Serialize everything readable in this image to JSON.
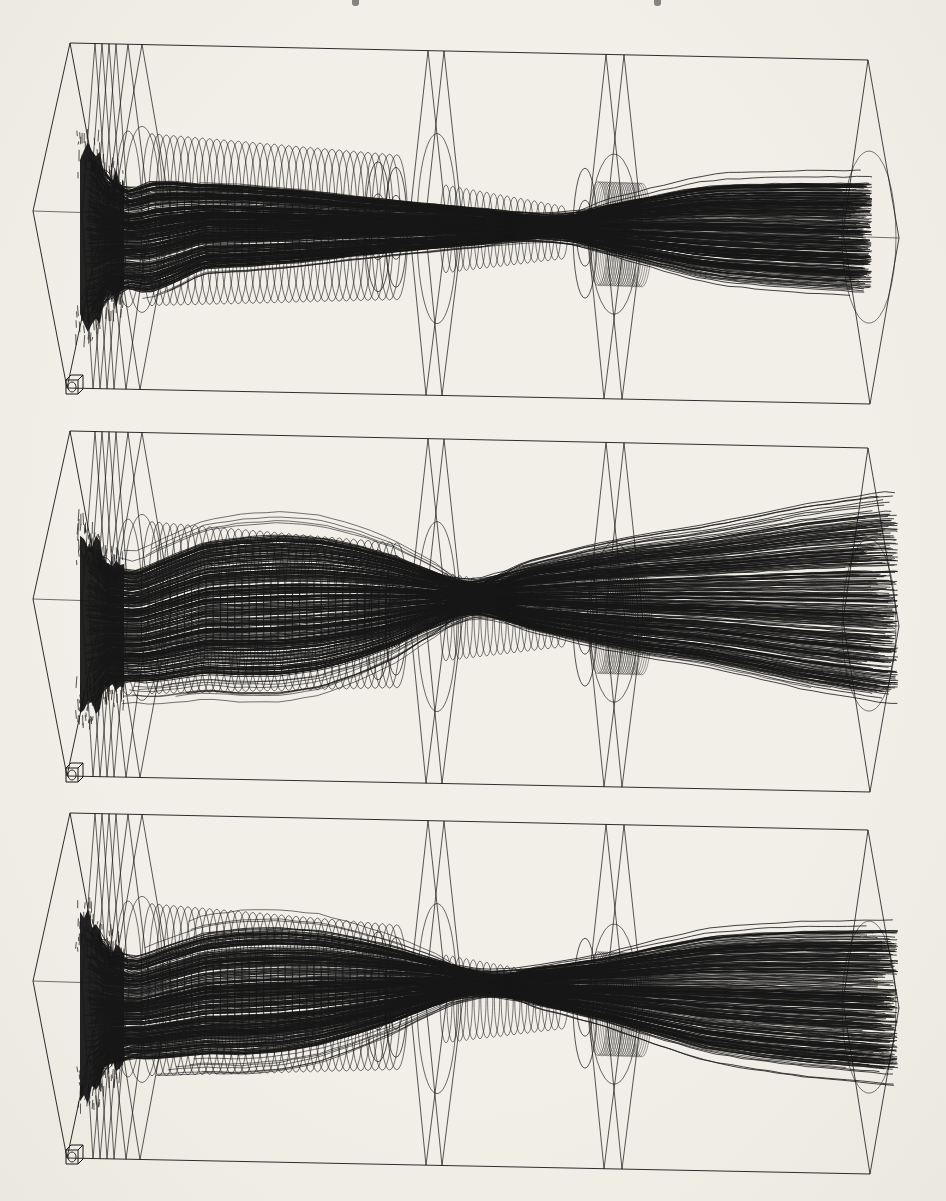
{
  "page": {
    "background_color": "#f0ede6",
    "ink_color": "#161616",
    "top_edge_cropped_text_marks": [
      352,
      654
    ]
  },
  "beamline": {
    "box": {
      "top_left": [
        70,
        7
      ],
      "top_right": [
        868,
        24
      ],
      "bottom_left": [
        67,
        352
      ],
      "bottom_right": [
        870,
        368
      ],
      "left_vertex": [
        33,
        175
      ],
      "right_vertex": [
        899,
        202
      ],
      "right_face_left_vertex": [
        843,
        196
      ]
    },
    "left_face_right_vertex": [
      103,
      183
    ],
    "left_planes_x": [
      95,
      102,
      109,
      116
    ],
    "left_plane_halfwidth": 13,
    "wide_planes": [
      {
        "x": 128,
        "halfwidth": 22,
        "circle_rx": 14,
        "circle_ry": 88
      },
      {
        "x": 142,
        "halfwidth": 30,
        "circle_rx": 19,
        "circle_ry": 93
      }
    ],
    "source_circles": [
      {
        "x": 104,
        "dy": -55,
        "rx": 8,
        "ry": 13
      },
      {
        "x": 106,
        "dy": 48,
        "rx": 8,
        "ry": 14
      }
    ],
    "rings_drift1": {
      "x_start": 152,
      "x_end": 398,
      "step": 7.2,
      "rx": 11,
      "ry_start": 86,
      "ry_slope": 0.055
    },
    "lens2": {
      "ellipse_pairs": [
        {
          "x": 378,
          "rx": 13,
          "ry_outer": 65,
          "ry_inner": 33
        },
        {
          "x": 396,
          "rx": 11,
          "ry_outer": 60,
          "ry_inner": 32
        }
      ],
      "plane_x": [
        428,
        444
      ],
      "plane_halfwidth": 19,
      "circle": {
        "x": 437,
        "rx": 20,
        "ry": 95
      }
    },
    "rings_drift2": {
      "x_start": 446,
      "x_end": 562,
      "step": 6.8,
      "rx": 6,
      "ry_start": 44,
      "ry_slope": 0.15
    },
    "lens3": {
      "ellipse_pairs": [
        {
          "x": 585,
          "rx": 12,
          "ry_outer": 65,
          "ry_inner": 33
        }
      ],
      "hatch": {
        "x_start": 598,
        "x_end": 642,
        "step": 2.3,
        "rx": 10,
        "ry": 52
      },
      "plane_x": [
        606,
        624
      ],
      "plane_halfwidth": 19,
      "circle": {
        "x": 614,
        "rx": 24,
        "ry": 80
      }
    },
    "right_face_circle": {
      "cx": 869,
      "rx": 27,
      "ry": 86
    },
    "origin_cube": {
      "x": 66,
      "y": 339
    },
    "ring_center_drop": 5
  },
  "panels": [
    {
      "name": "top",
      "seed": 11,
      "n_rays": 310,
      "envelope": [
        [
          86,
          84
        ],
        [
          98,
          82
        ],
        [
          106,
          56
        ],
        [
          116,
          60
        ],
        [
          126,
          50
        ],
        [
          150,
          57
        ],
        [
          175,
          52
        ],
        [
          200,
          44
        ],
        [
          250,
          41
        ],
        [
          300,
          37
        ],
        [
          350,
          31
        ],
        [
          400,
          26
        ],
        [
          450,
          21
        ],
        [
          500,
          17
        ],
        [
          545,
          15
        ],
        [
          575,
          17
        ],
        [
          605,
          23
        ],
        [
          635,
          30
        ],
        [
          665,
          37
        ],
        [
          695,
          44
        ],
        [
          725,
          48
        ],
        [
          760,
          50
        ],
        [
          800,
          52
        ],
        [
          840,
          53
        ],
        [
          862,
          54
        ]
      ],
      "center_offset": [
        [
          33,
          24
        ],
        [
          140,
          25
        ],
        [
          205,
          10
        ],
        [
          540,
          0
        ],
        [
          899,
          0
        ]
      ],
      "waist_x": 545,
      "blend": 70,
      "a_levels": 0,
      "b_levels": 0,
      "end_x": 872,
      "ragged": 40,
      "stray_rays": 5,
      "stray_amp": 0.09,
      "outlier_frac": 0.05
    },
    {
      "name": "middle",
      "seed": 22,
      "n_rays": 310,
      "envelope": [
        [
          86,
          84
        ],
        [
          98,
          80
        ],
        [
          106,
          56
        ],
        [
          116,
          60
        ],
        [
          130,
          56
        ],
        [
          160,
          62
        ],
        [
          200,
          67
        ],
        [
          240,
          71
        ],
        [
          280,
          72
        ],
        [
          320,
          68
        ],
        [
          360,
          58
        ],
        [
          395,
          46
        ],
        [
          425,
          32
        ],
        [
          450,
          24
        ],
        [
          475,
          19
        ],
        [
          500,
          24
        ],
        [
          540,
          33
        ],
        [
          590,
          44
        ],
        [
          640,
          53
        ],
        [
          700,
          61
        ],
        [
          750,
          70
        ],
        [
          800,
          80
        ],
        [
          847,
          87
        ],
        [
          884,
          92
        ]
      ],
      "center_offset": [
        [
          33,
          24
        ],
        [
          140,
          24
        ],
        [
          205,
          4
        ],
        [
          380,
          -8
        ],
        [
          480,
          -16
        ],
        [
          700,
          -21
        ],
        [
          899,
          -23
        ]
      ],
      "waist_x": 478,
      "blend": 55,
      "a_levels": 64,
      "b_levels": 34,
      "end_x": 898,
      "ragged": 55,
      "stray_rays": 14,
      "stray_amp": 0.32,
      "outlier_frac": 0.14
    },
    {
      "name": "bottom",
      "seed": 33,
      "n_rays": 310,
      "envelope": [
        [
          86,
          84
        ],
        [
          98,
          80
        ],
        [
          106,
          55
        ],
        [
          116,
          58
        ],
        [
          130,
          51
        ],
        [
          160,
          56
        ],
        [
          200,
          61
        ],
        [
          240,
          64
        ],
        [
          280,
          63
        ],
        [
          320,
          58
        ],
        [
          360,
          48
        ],
        [
          395,
          38
        ],
        [
          425,
          27
        ],
        [
          455,
          18
        ],
        [
          485,
          13
        ],
        [
          515,
          15
        ],
        [
          555,
          21
        ],
        [
          605,
          31
        ],
        [
          655,
          44
        ],
        [
          705,
          56
        ],
        [
          755,
          62
        ],
        [
          805,
          66
        ],
        [
          847,
          68
        ],
        [
          884,
          70
        ]
      ],
      "center_offset": [
        [
          33,
          24
        ],
        [
          140,
          24
        ],
        [
          205,
          8
        ],
        [
          450,
          -12
        ],
        [
          600,
          -10
        ],
        [
          899,
          -8
        ]
      ],
      "waist_x": 487,
      "blend": 60,
      "a_levels": 90,
      "b_levels": 46,
      "end_x": 898,
      "ragged": 50,
      "stray_rays": 10,
      "stray_amp": 0.3,
      "outlier_frac": 0.12
    }
  ]
}
